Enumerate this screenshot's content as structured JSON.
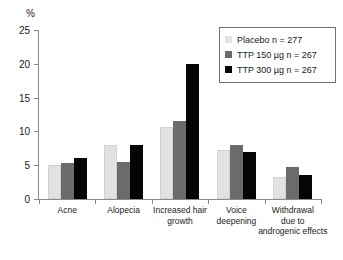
{
  "chart_data": {
    "type": "bar",
    "title": "",
    "xlabel": "",
    "ylabel": "%",
    "ylim": [
      0,
      25
    ],
    "yticks": [
      0,
      5,
      10,
      15,
      20,
      25
    ],
    "ytick_labels": [
      "0",
      "5",
      "10",
      "15",
      "20",
      "25"
    ],
    "grid": false,
    "legend_position": "top-right",
    "categories": [
      "Acne",
      "Alopecia",
      "Increased hair growth",
      "Voice deepening",
      "Withdrawal due to androgenic effects"
    ],
    "category_label_lines": [
      [
        "Acne"
      ],
      [
        "Alopecia"
      ],
      [
        "Increased hair",
        "growth"
      ],
      [
        "Voice",
        "deepening"
      ],
      [
        "Withdrawal",
        "due to",
        "androgenic effects"
      ]
    ],
    "series": [
      {
        "name": "Placebo n = 277",
        "color": "#e2e2e2",
        "values": [
          5.0,
          8.0,
          10.7,
          7.3,
          3.3
        ]
      },
      {
        "name": "TTP 150 µg n = 267",
        "color": "#6b6b6b",
        "values": [
          5.4,
          5.5,
          11.6,
          8.0,
          4.7
        ]
      },
      {
        "name": "TTP 300 µg n = 267",
        "color": "#050505",
        "values": [
          6.0,
          8.0,
          19.9,
          7.0,
          3.5
        ]
      }
    ],
    "legend": [
      "Placebo n = 277",
      "TTP 150 µg n = 267",
      "TTP 300 µg n = 267"
    ]
  }
}
